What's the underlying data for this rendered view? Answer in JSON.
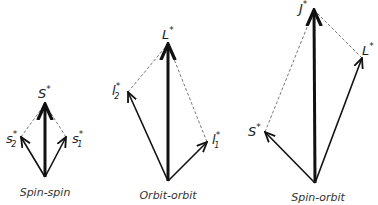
{
  "diagrams": [
    {
      "id": "spin-spin",
      "caption": "Spin-spin",
      "origin": [
        45,
        177
      ],
      "resultant": {
        "name": "S",
        "sup": "*",
        "sub": "",
        "tip": [
          45,
          104
        ]
      },
      "components": [
        {
          "name": "s",
          "sup": "*",
          "sub": "2",
          "tip": [
            21,
            137
          ]
        },
        {
          "name": "s",
          "sup": "*",
          "sub": "1",
          "tip": [
            66,
            137
          ]
        }
      ]
    },
    {
      "id": "orbit-orbit",
      "caption": "Orbit-orbit",
      "origin": [
        168,
        181
      ],
      "resultant": {
        "name": "L",
        "sup": "*",
        "sub": "",
        "tip": [
          168,
          44
        ]
      },
      "components": [
        {
          "name": "l",
          "sup": "*",
          "sub": "2",
          "tip": [
            128,
            92
          ]
        },
        {
          "name": "l",
          "sup": "*",
          "sub": "1",
          "tip": [
            207,
            142
          ]
        }
      ]
    },
    {
      "id": "spin-orbit",
      "caption": "Spin-orbit",
      "origin": [
        315,
        183
      ],
      "resultant": {
        "name": "J",
        "sup": "*",
        "sub": "",
        "tip": [
          314,
          10
        ]
      },
      "components": [
        {
          "name": "S",
          "sup": "*",
          "sub": "",
          "tip": [
            265,
            132
          ]
        },
        {
          "name": "L",
          "sup": "*",
          "sub": "",
          "tip": [
            362,
            58
          ]
        }
      ]
    }
  ],
  "colors": {
    "vector": "#111111",
    "dashed": "#555555",
    "text": "#222222"
  }
}
